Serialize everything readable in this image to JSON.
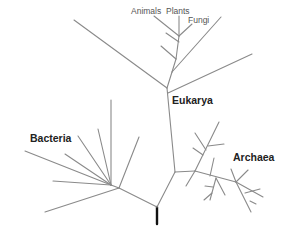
{
  "diagram": {
    "domains": [
      {
        "name": "Eukarya"
      },
      {
        "name": "Bacteria"
      },
      {
        "name": "Archaea"
      }
    ],
    "leaf_labels": [
      "Animals",
      "Plants",
      "Fungi"
    ],
    "colors": {
      "branch": "#8a8a8a",
      "root": "#111111",
      "label": "#222222"
    }
  },
  "labels": {
    "animals": "Animals",
    "plants": "Plants",
    "fungi": "Fungi",
    "eukarya": "Eukarya",
    "bacteria": "Bacteria",
    "archaea": "Archaea"
  }
}
